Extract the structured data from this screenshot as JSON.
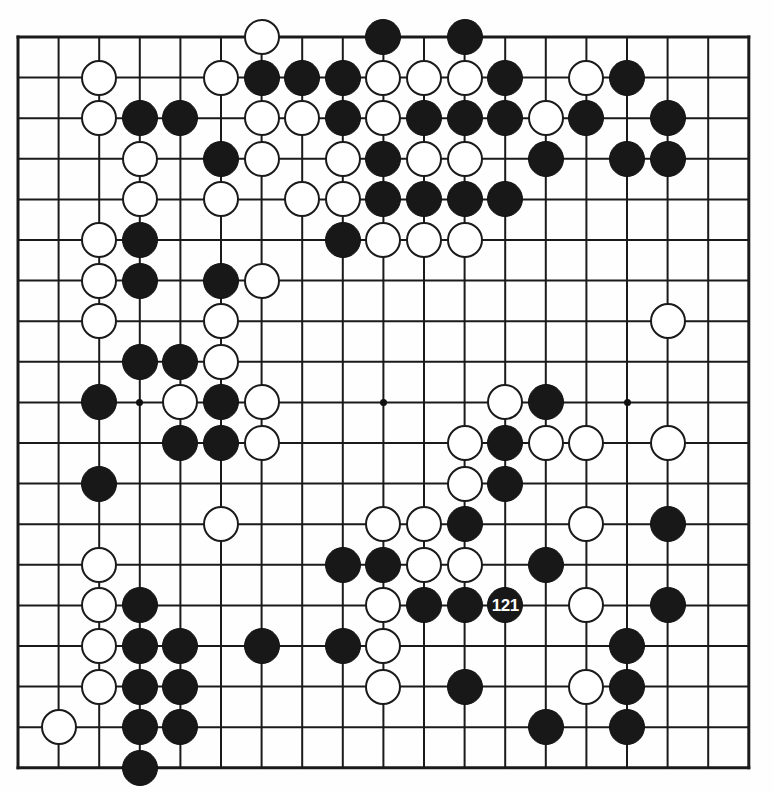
{
  "board": {
    "kind": "go-board-diagram",
    "size": 19,
    "grid": {
      "left": 18,
      "top": 37,
      "spacing": 40.6,
      "line_color": "#1a1a1a",
      "edge_line_width": 3,
      "inner_line_width": 2,
      "background": "#fefefe"
    },
    "stone": {
      "diameter": 36,
      "black_color": "#181818",
      "white_color": "#ffffff",
      "outline_color": "#1a1a1a"
    },
    "star_points": [
      {
        "col": 3,
        "row": 9
      },
      {
        "col": 9,
        "row": 9
      },
      {
        "col": 15,
        "row": 9
      },
      {
        "col": 15,
        "row": 15
      }
    ],
    "last_move": {
      "col": 12,
      "row": 14,
      "color": "black",
      "label": "121"
    },
    "labels": [
      "121"
    ],
    "stones": [
      {
        "col": 6,
        "row": 0,
        "color": "white"
      },
      {
        "col": 9,
        "row": 0,
        "color": "black"
      },
      {
        "col": 11,
        "row": 0,
        "color": "black"
      },
      {
        "col": 2,
        "row": 1,
        "color": "white"
      },
      {
        "col": 5,
        "row": 1,
        "color": "white"
      },
      {
        "col": 6,
        "row": 1,
        "color": "black"
      },
      {
        "col": 7,
        "row": 1,
        "color": "black"
      },
      {
        "col": 8,
        "row": 1,
        "color": "black"
      },
      {
        "col": 9,
        "row": 1,
        "color": "white"
      },
      {
        "col": 10,
        "row": 1,
        "color": "white"
      },
      {
        "col": 11,
        "row": 1,
        "color": "white"
      },
      {
        "col": 12,
        "row": 1,
        "color": "black"
      },
      {
        "col": 14,
        "row": 1,
        "color": "white"
      },
      {
        "col": 15,
        "row": 1,
        "color": "black"
      },
      {
        "col": 2,
        "row": 2,
        "color": "white"
      },
      {
        "col": 3,
        "row": 2,
        "color": "black"
      },
      {
        "col": 4,
        "row": 2,
        "color": "black"
      },
      {
        "col": 6,
        "row": 2,
        "color": "white"
      },
      {
        "col": 7,
        "row": 2,
        "color": "white"
      },
      {
        "col": 8,
        "row": 2,
        "color": "black"
      },
      {
        "col": 9,
        "row": 2,
        "color": "white"
      },
      {
        "col": 10,
        "row": 2,
        "color": "black"
      },
      {
        "col": 11,
        "row": 2,
        "color": "black"
      },
      {
        "col": 12,
        "row": 2,
        "color": "black"
      },
      {
        "col": 13,
        "row": 2,
        "color": "white"
      },
      {
        "col": 14,
        "row": 2,
        "color": "black"
      },
      {
        "col": 16,
        "row": 2,
        "color": "black"
      },
      {
        "col": 3,
        "row": 3,
        "color": "white"
      },
      {
        "col": 5,
        "row": 3,
        "color": "black"
      },
      {
        "col": 6,
        "row": 3,
        "color": "white"
      },
      {
        "col": 8,
        "row": 3,
        "color": "white"
      },
      {
        "col": 9,
        "row": 3,
        "color": "black"
      },
      {
        "col": 10,
        "row": 3,
        "color": "white"
      },
      {
        "col": 11,
        "row": 3,
        "color": "white"
      },
      {
        "col": 13,
        "row": 3,
        "color": "black"
      },
      {
        "col": 15,
        "row": 3,
        "color": "black"
      },
      {
        "col": 16,
        "row": 3,
        "color": "black"
      },
      {
        "col": 3,
        "row": 4,
        "color": "white"
      },
      {
        "col": 5,
        "row": 4,
        "color": "white"
      },
      {
        "col": 7,
        "row": 4,
        "color": "white"
      },
      {
        "col": 8,
        "row": 4,
        "color": "white"
      },
      {
        "col": 9,
        "row": 4,
        "color": "black"
      },
      {
        "col": 10,
        "row": 4,
        "color": "black"
      },
      {
        "col": 11,
        "row": 4,
        "color": "black"
      },
      {
        "col": 12,
        "row": 4,
        "color": "black"
      },
      {
        "col": 2,
        "row": 5,
        "color": "white"
      },
      {
        "col": 3,
        "row": 5,
        "color": "black"
      },
      {
        "col": 8,
        "row": 5,
        "color": "black"
      },
      {
        "col": 9,
        "row": 5,
        "color": "white"
      },
      {
        "col": 10,
        "row": 5,
        "color": "white"
      },
      {
        "col": 11,
        "row": 5,
        "color": "white"
      },
      {
        "col": 2,
        "row": 6,
        "color": "white"
      },
      {
        "col": 3,
        "row": 6,
        "color": "black"
      },
      {
        "col": 5,
        "row": 6,
        "color": "black"
      },
      {
        "col": 6,
        "row": 6,
        "color": "white"
      },
      {
        "col": 2,
        "row": 7,
        "color": "white"
      },
      {
        "col": 5,
        "row": 7,
        "color": "white"
      },
      {
        "col": 3,
        "row": 8,
        "color": "black"
      },
      {
        "col": 4,
        "row": 8,
        "color": "black"
      },
      {
        "col": 5,
        "row": 8,
        "color": "white"
      },
      {
        "col": 16,
        "row": 7,
        "color": "white"
      },
      {
        "col": 2,
        "row": 9,
        "color": "black"
      },
      {
        "col": 4,
        "row": 9,
        "color": "white"
      },
      {
        "col": 5,
        "row": 9,
        "color": "black"
      },
      {
        "col": 6,
        "row": 9,
        "color": "white"
      },
      {
        "col": 12,
        "row": 9,
        "color": "white"
      },
      {
        "col": 13,
        "row": 9,
        "color": "black"
      },
      {
        "col": 4,
        "row": 10,
        "color": "black"
      },
      {
        "col": 5,
        "row": 10,
        "color": "black"
      },
      {
        "col": 6,
        "row": 10,
        "color": "white"
      },
      {
        "col": 11,
        "row": 10,
        "color": "white"
      },
      {
        "col": 12,
        "row": 10,
        "color": "black"
      },
      {
        "col": 13,
        "row": 10,
        "color": "white"
      },
      {
        "col": 14,
        "row": 10,
        "color": "white"
      },
      {
        "col": 16,
        "row": 10,
        "color": "white"
      },
      {
        "col": 2,
        "row": 11,
        "color": "black"
      },
      {
        "col": 11,
        "row": 11,
        "color": "white"
      },
      {
        "col": 12,
        "row": 11,
        "color": "black"
      },
      {
        "col": 5,
        "row": 12,
        "color": "white"
      },
      {
        "col": 9,
        "row": 12,
        "color": "white"
      },
      {
        "col": 10,
        "row": 12,
        "color": "white"
      },
      {
        "col": 11,
        "row": 12,
        "color": "black"
      },
      {
        "col": 14,
        "row": 12,
        "color": "white"
      },
      {
        "col": 16,
        "row": 12,
        "color": "black"
      },
      {
        "col": 2,
        "row": 13,
        "color": "white"
      },
      {
        "col": 8,
        "row": 13,
        "color": "black"
      },
      {
        "col": 9,
        "row": 13,
        "color": "black"
      },
      {
        "col": 10,
        "row": 13,
        "color": "white"
      },
      {
        "col": 11,
        "row": 13,
        "color": "white"
      },
      {
        "col": 13,
        "row": 13,
        "color": "black"
      },
      {
        "col": 2,
        "row": 14,
        "color": "white"
      },
      {
        "col": 3,
        "row": 14,
        "color": "black"
      },
      {
        "col": 9,
        "row": 14,
        "color": "white"
      },
      {
        "col": 10,
        "row": 14,
        "color": "black"
      },
      {
        "col": 11,
        "row": 14,
        "color": "black"
      },
      {
        "col": 12,
        "row": 14,
        "color": "black"
      },
      {
        "col": 14,
        "row": 14,
        "color": "white"
      },
      {
        "col": 16,
        "row": 14,
        "color": "black"
      },
      {
        "col": 2,
        "row": 15,
        "color": "white"
      },
      {
        "col": 3,
        "row": 15,
        "color": "black"
      },
      {
        "col": 4,
        "row": 15,
        "color": "black"
      },
      {
        "col": 6,
        "row": 15,
        "color": "black"
      },
      {
        "col": 8,
        "row": 15,
        "color": "black"
      },
      {
        "col": 9,
        "row": 15,
        "color": "white"
      },
      {
        "col": 15,
        "row": 15,
        "color": "black"
      },
      {
        "col": 2,
        "row": 16,
        "color": "white"
      },
      {
        "col": 3,
        "row": 16,
        "color": "black"
      },
      {
        "col": 4,
        "row": 16,
        "color": "black"
      },
      {
        "col": 9,
        "row": 16,
        "color": "white"
      },
      {
        "col": 11,
        "row": 16,
        "color": "black"
      },
      {
        "col": 14,
        "row": 16,
        "color": "white"
      },
      {
        "col": 15,
        "row": 16,
        "color": "black"
      },
      {
        "col": 1,
        "row": 17,
        "color": "white"
      },
      {
        "col": 3,
        "row": 17,
        "color": "black"
      },
      {
        "col": 4,
        "row": 17,
        "color": "black"
      },
      {
        "col": 13,
        "row": 17,
        "color": "black"
      },
      {
        "col": 15,
        "row": 17,
        "color": "black"
      },
      {
        "col": 3,
        "row": 18,
        "color": "black"
      }
    ]
  }
}
